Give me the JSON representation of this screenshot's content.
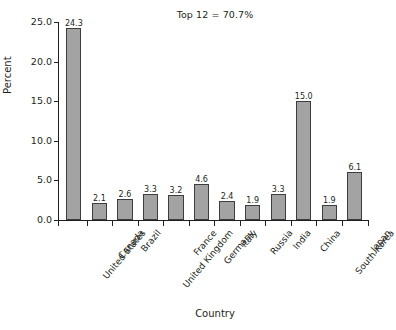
{
  "chart_data": {
    "type": "bar",
    "title": "",
    "title_cut_off": "",
    "annotation": "Top 12 = 70.7%",
    "xlabel": "Country",
    "ylabel": "Percent",
    "ylim": [
      0,
      25
    ],
    "yticks": [
      "0.0",
      "5.0",
      "10.0",
      "15.0",
      "20.0",
      "25.0"
    ],
    "ytick_values": [
      0,
      5,
      10,
      15,
      20,
      25
    ],
    "grid": false,
    "legend": "none",
    "categories": [
      "United States",
      "Canada",
      "Brazil",
      "United Kingdom",
      "France",
      "Germany",
      "Italy",
      "Russia",
      "India",
      "China",
      "South Korea",
      "Japan"
    ],
    "values": [
      24.3,
      2.1,
      2.6,
      3.3,
      3.2,
      4.6,
      2.4,
      1.9,
      3.3,
      15.0,
      1.9,
      6.1
    ],
    "value_labels": [
      "24.3",
      "2.1",
      "2.6",
      "3.3",
      "3.2",
      "4.6",
      "2.4",
      "1.9",
      "3.3",
      "15.0",
      "1.9",
      "6.1"
    ],
    "bar_fill_color": "#a3a3a3",
    "bar_edge_color": "#3d3d3d",
    "axis_color": "#231f20",
    "background_color": "#ffffff"
  }
}
